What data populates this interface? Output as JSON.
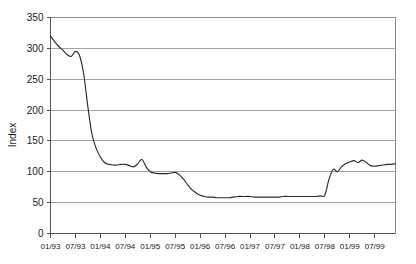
{
  "chart_data": {
    "type": "line",
    "title": "",
    "subtitle": "",
    "xlabel": "",
    "ylabel": "Index",
    "ylim": [
      0,
      350
    ],
    "yticks": [
      0,
      50,
      100,
      150,
      200,
      250,
      300,
      350
    ],
    "ytick_labels": [
      "0",
      "50",
      "100",
      "150",
      "200",
      "250",
      "300",
      "350"
    ],
    "grid": true,
    "legend": false,
    "legend_position": "none",
    "xtick_labels": [
      "01/93",
      "07/93",
      "01/94",
      "07/94",
      "01/95",
      "07/95",
      "01/96",
      "07/96",
      "01/97",
      "07/97",
      "01/98",
      "07/98",
      "01/99",
      "07/99"
    ],
    "x": [
      "01/93",
      "02/93",
      "03/93",
      "04/93",
      "05/93",
      "06/93",
      "07/93",
      "08/93",
      "09/93",
      "10/93",
      "11/93",
      "12/93",
      "01/94",
      "02/94",
      "03/94",
      "04/94",
      "05/94",
      "06/94",
      "07/94",
      "08/94",
      "09/94",
      "10/94",
      "11/94",
      "12/94",
      "01/95",
      "02/95",
      "03/95",
      "04/95",
      "05/95",
      "06/95",
      "07/95",
      "08/95",
      "09/95",
      "10/95",
      "11/95",
      "12/95",
      "01/96",
      "02/96",
      "03/96",
      "04/96",
      "05/96",
      "06/96",
      "07/96",
      "08/96",
      "09/96",
      "10/96",
      "11/96",
      "12/96",
      "01/97",
      "02/97",
      "03/97",
      "04/97",
      "05/97",
      "06/97",
      "07/97",
      "08/97",
      "09/97",
      "10/97",
      "11/97",
      "12/97",
      "01/98",
      "02/98",
      "03/98",
      "04/98",
      "05/98",
      "06/98",
      "07/98",
      "08/98",
      "09/98",
      "10/98",
      "11/98",
      "12/98",
      "01/99",
      "02/99",
      "03/99",
      "04/99",
      "05/99",
      "06/99",
      "07/99",
      "08/99",
      "09/99",
      "10/99",
      "11/99",
      "12/99"
    ],
    "series": [
      {
        "name": "Index",
        "color": "#2b2b2b",
        "values": [
          320,
          311,
          303,
          297,
          290,
          287,
          295,
          288,
          258,
          205,
          160,
          138,
          124,
          115,
          112,
          111,
          111,
          112,
          112,
          110,
          108,
          113,
          120,
          108,
          100,
          98,
          97,
          97,
          97,
          98,
          99,
          95,
          88,
          79,
          71,
          66,
          62,
          60,
          59,
          59,
          58,
          58,
          58,
          58,
          59,
          60,
          60,
          60,
          60,
          59,
          59,
          59,
          59,
          59,
          59,
          59,
          60,
          60,
          60,
          60,
          60,
          60,
          60,
          60,
          60,
          61,
          62,
          88,
          104,
          100,
          108,
          113,
          116,
          118,
          115,
          119,
          115,
          110,
          109,
          110,
          111,
          112,
          112,
          113
        ]
      }
    ]
  },
  "axes": {
    "y_axis_title": "Index"
  }
}
